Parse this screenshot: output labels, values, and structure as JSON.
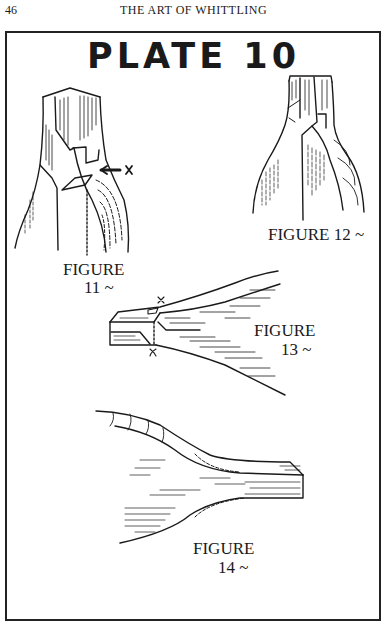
{
  "page": {
    "number": "46",
    "running_head": "THE ART OF WHITTLING"
  },
  "plate": {
    "title": "PLATE 10"
  },
  "figures": [
    {
      "label": "FIGURE",
      "number": "11 ~",
      "marker": "x"
    },
    {
      "label": "FIGURE",
      "number": "12 ~",
      "combined": "FIGURE  12 ~"
    },
    {
      "label": "FIGURE",
      "number": "13 ~",
      "markers": [
        "x",
        "x"
      ]
    },
    {
      "label": "FIGURE",
      "number": "14 ~"
    }
  ],
  "colors": {
    "ink": "#1a1a1a",
    "paper": "#ffffff"
  }
}
